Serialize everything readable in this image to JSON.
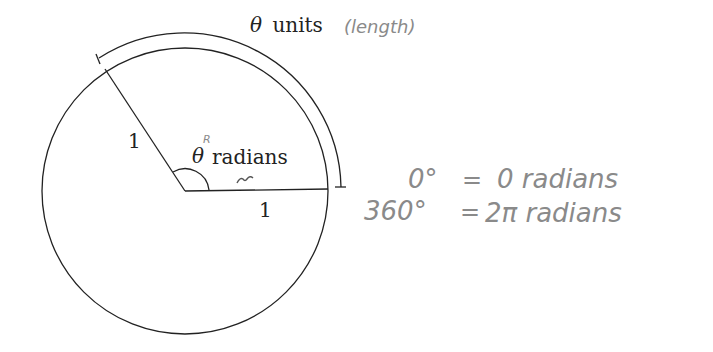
{
  "diagram": {
    "arc_label": {
      "symbol": "θ",
      "text": "units",
      "annotation": "(length)"
    },
    "angle_label": {
      "symbol": "θ",
      "superscript": "R",
      "text": "radians",
      "underline_mark": "~"
    },
    "radius_labels": [
      "1",
      "1"
    ],
    "equations": [
      {
        "lhs": "0°",
        "eq": "=",
        "rhs": "0 radians"
      },
      {
        "lhs": "360°",
        "eq": "=",
        "rhs": "2π radians"
      }
    ],
    "colors": {
      "ink": "#222222",
      "pencil": "#8a8a8a",
      "background": "#ffffff"
    }
  }
}
